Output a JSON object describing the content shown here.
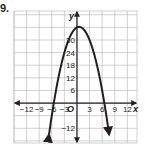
{
  "problem": {
    "number": "9."
  },
  "chart_data": {
    "type": "line",
    "title": "",
    "xlabel": "x",
    "ylabel": "y",
    "origin_label": "O",
    "xlim": [
      -15,
      14.3
    ],
    "ylim": [
      -19,
      43.8
    ],
    "grid": true,
    "x_ticks": [
      -12,
      -9,
      -6,
      -3,
      3,
      6,
      9,
      12
    ],
    "x_tick_labels": [
      "−12",
      "−9",
      "−6",
      "−3",
      "3",
      "6",
      "9",
      "12"
    ],
    "y_ticks": [
      -12,
      6,
      12,
      18,
      24,
      30
    ],
    "y_tick_labels": [
      "−12",
      "6",
      "12",
      "18",
      "24",
      "30"
    ],
    "series": [
      {
        "name": "parabola",
        "equation": "y = -(x - 0.5)^2 + 36.25",
        "vertex": [
          0.5,
          36.25
        ],
        "x_intercepts": [
          -5.5,
          6.5
        ],
        "color": "#231f20",
        "arrows": "both ends, pointing down"
      }
    ],
    "colors": {
      "grid": "#bdbdbd",
      "axis": "#231f20",
      "curve": "#231f20"
    }
  }
}
